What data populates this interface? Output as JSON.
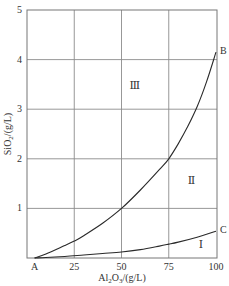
{
  "chart_data": {
    "type": "line",
    "title": "",
    "xlabel": "Al2O3/(g/L)",
    "ylabel": "SiO2/(g/L)",
    "xlim": [
      0,
      100
    ],
    "ylim": [
      0,
      5
    ],
    "grid": true,
    "x_ticks": [
      "A",
      "25",
      "50",
      "75",
      "100"
    ],
    "y_ticks": [
      "1",
      "2",
      "3",
      "4",
      "5"
    ],
    "series": [
      {
        "name": "A–B curve",
        "end_label": "B",
        "x": [
          4,
          10,
          20,
          25,
          30,
          40,
          50,
          60,
          70,
          75,
          80,
          85,
          90,
          95,
          100
        ],
        "values": [
          0,
          0.08,
          0.25,
          0.34,
          0.45,
          0.7,
          1.0,
          1.37,
          1.78,
          2.0,
          2.3,
          2.65,
          3.05,
          3.55,
          4.15
        ]
      },
      {
        "name": "A–C curve",
        "end_label": "C",
        "x": [
          4,
          10,
          20,
          30,
          40,
          50,
          60,
          70,
          75,
          80,
          90,
          100
        ],
        "values": [
          0,
          0.01,
          0.03,
          0.06,
          0.09,
          0.12,
          0.17,
          0.24,
          0.28,
          0.32,
          0.42,
          0.54
        ]
      }
    ],
    "annotations": [
      {
        "text": "Ⅲ",
        "x": 57,
        "y": 3.4
      },
      {
        "text": "Ⅱ",
        "x": 87,
        "y": 1.5
      },
      {
        "text": "Ⅰ",
        "x": 92,
        "y": 0.2
      },
      {
        "text": "A",
        "x": 4,
        "y": 0
      },
      {
        "text": "B",
        "x": 100,
        "y": 4.15
      },
      {
        "text": "C",
        "x": 100,
        "y": 0.54
      }
    ]
  },
  "labels": {
    "xaxis": "Al",
    "xaxis_sub1": "2",
    "xaxis_mid": "O",
    "xaxis_sub2": "3",
    "xaxis_unit": "/(g/L)",
    "yaxis": "SiO",
    "yaxis_sub": "2",
    "yaxis_unit": "/(g/L)"
  }
}
